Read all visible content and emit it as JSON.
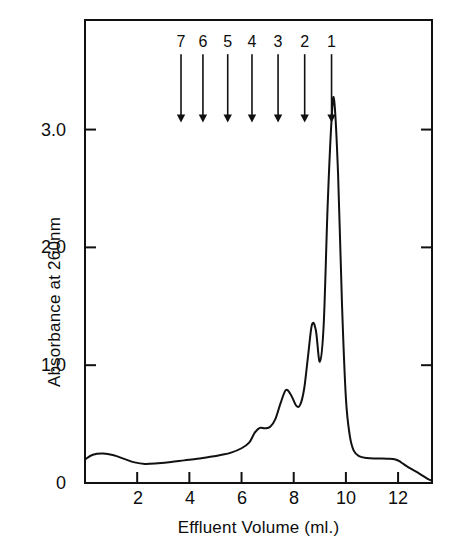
{
  "chart_data": {
    "type": "line",
    "title": "",
    "xlabel": "Effluent Volume (ml.)",
    "ylabel": "Absorbance at 260nm",
    "xlim": [
      0,
      13.3
    ],
    "ylim": [
      0,
      3.93
    ],
    "grid": false,
    "legend": "none",
    "xticks": [
      "2",
      "4",
      "6",
      "8",
      "10",
      "12"
    ],
    "xtick_values": [
      2,
      4,
      6,
      8,
      10,
      12
    ],
    "yticks": [
      "0",
      "1.0",
      "2.0",
      "3.0"
    ],
    "ytick_values": [
      0,
      1.0,
      2.0,
      3.0
    ],
    "series": [
      {
        "name": "Absorbance at 260nm",
        "x": [
          0.0,
          0.3,
          0.7,
          1.1,
          1.5,
          1.9,
          2.3,
          2.8,
          3.3,
          3.8,
          4.3,
          4.8,
          5.2,
          5.6,
          6.0,
          6.3,
          6.5,
          6.7,
          6.9,
          7.1,
          7.3,
          7.5,
          7.7,
          7.9,
          8.1,
          8.25,
          8.4,
          8.55,
          8.7,
          8.85,
          9.0,
          9.15,
          9.3,
          9.45,
          9.55,
          9.7,
          9.85,
          10.0,
          10.15,
          10.3,
          10.5,
          10.8,
          11.2,
          11.6,
          11.9,
          12.1,
          12.4,
          12.8,
          13.1,
          13.3
        ],
        "y": [
          0.2,
          0.24,
          0.25,
          0.235,
          0.205,
          0.175,
          0.162,
          0.168,
          0.178,
          0.192,
          0.205,
          0.222,
          0.238,
          0.258,
          0.295,
          0.345,
          0.425,
          0.468,
          0.465,
          0.478,
          0.545,
          0.68,
          0.79,
          0.745,
          0.655,
          0.665,
          0.8,
          1.08,
          1.345,
          1.295,
          1.03,
          1.35,
          2.35,
          3.08,
          3.25,
          2.62,
          1.52,
          0.72,
          0.4,
          0.275,
          0.228,
          0.212,
          0.208,
          0.206,
          0.2,
          0.178,
          0.132,
          0.082,
          0.04,
          0.018
        ]
      }
    ],
    "annotations": {
      "kind": "down-arrows",
      "markers": [
        {
          "label": "7",
          "x": 3.68
        },
        {
          "label": "6",
          "x": 4.52
        },
        {
          "label": "5",
          "x": 5.47
        },
        {
          "label": "4",
          "x": 6.4
        },
        {
          "label": "3",
          "x": 7.4
        },
        {
          "label": "2",
          "x": 8.42
        },
        {
          "label": "1",
          "x": 9.45
        }
      ],
      "label_y": 3.78,
      "arrow_top_y": 3.64,
      "arrow_tip_y": 3.06
    }
  }
}
